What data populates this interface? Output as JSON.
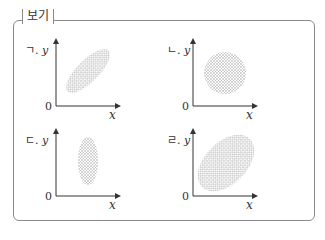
{
  "box": {
    "title": "보기"
  },
  "panels": [
    {
      "label": "ㄱ.",
      "axis_y": "y",
      "axis_x": "x",
      "origin": "0",
      "shape": "ellipse-tilted-narrow",
      "correlation": "strong positive"
    },
    {
      "label": "ㄴ.",
      "axis_y": "y",
      "axis_x": "x",
      "origin": "0",
      "shape": "circle",
      "correlation": "none"
    },
    {
      "label": "ㄷ.",
      "axis_y": "y",
      "axis_x": "x",
      "origin": "0",
      "shape": "ellipse-vertical",
      "correlation": "none"
    },
    {
      "label": "ㄹ.",
      "axis_y": "y",
      "axis_x": "x",
      "origin": "0",
      "shape": "ellipse-tilted-wide",
      "correlation": "weak positive"
    }
  ],
  "colors": {
    "frame": "#8a8a8a",
    "dots": "#9a9a9a",
    "axis": "#333333"
  }
}
